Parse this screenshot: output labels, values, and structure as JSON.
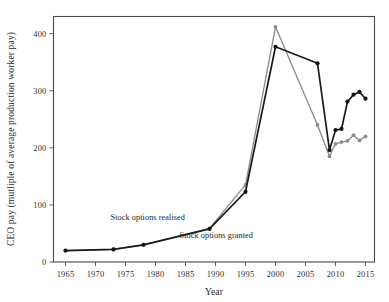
{
  "chart_data": {
    "type": "line",
    "title": "",
    "xlabel": "Year",
    "ylabel": "CEO pay (mutliple of average production worker pay)",
    "xlim": [
      1963,
      2016.5
    ],
    "ylim": [
      0,
      430
    ],
    "xticks": [
      1965,
      1970,
      1975,
      1980,
      1985,
      1990,
      1995,
      2000,
      2005,
      2010,
      2015
    ],
    "xtick_labels": [
      "1965",
      "1970",
      "1975",
      "1980",
      "1985",
      "1990",
      "1995",
      "2000",
      "2005",
      "2010",
      "2015"
    ],
    "yticks": [
      0,
      100,
      200,
      300,
      400
    ],
    "ytick_labels": [
      "0",
      "100",
      "200",
      "300",
      "400"
    ],
    "grid": false,
    "legend_position": "inline-annotations",
    "series": [
      {
        "name": "Stock options realised",
        "color": "#141414",
        "marker": "circle",
        "points": [
          {
            "x": 1965,
            "y": 20
          },
          {
            "x": 1973,
            "y": 22
          },
          {
            "x": 1978,
            "y": 30
          },
          {
            "x": 1989,
            "y": 58
          },
          {
            "x": 1995,
            "y": 123
          },
          {
            "x": 2000,
            "y": 377
          },
          {
            "x": 2007,
            "y": 348
          },
          {
            "x": 2009,
            "y": 196
          },
          {
            "x": 2010,
            "y": 231
          },
          {
            "x": 2011,
            "y": 233
          },
          {
            "x": 2012,
            "y": 281
          },
          {
            "x": 2013,
            "y": 293
          },
          {
            "x": 2014,
            "y": 298
          },
          {
            "x": 2015,
            "y": 286
          }
        ]
      },
      {
        "name": "Stock options granted",
        "color": "#8c8c8c",
        "marker": "circle",
        "points": [
          {
            "x": 1965,
            "y": 20
          },
          {
            "x": 1973,
            "y": 22
          },
          {
            "x": 1978,
            "y": 30
          },
          {
            "x": 1989,
            "y": 59
          },
          {
            "x": 1995,
            "y": 135
          },
          {
            "x": 2000,
            "y": 412
          },
          {
            "x": 2007,
            "y": 240
          },
          {
            "x": 2009,
            "y": 185
          },
          {
            "x": 2010,
            "y": 207
          },
          {
            "x": 2011,
            "y": 210
          },
          {
            "x": 2012,
            "y": 212
          },
          {
            "x": 2013,
            "y": 222
          },
          {
            "x": 2014,
            "y": 213
          },
          {
            "x": 2015,
            "y": 220
          }
        ]
      }
    ],
    "annotations": [
      {
        "text": "Stock options realised",
        "x": 1972.5,
        "y": 74,
        "anchor": "start"
      },
      {
        "text": "Stock options granted",
        "x": 1984.0,
        "y": 42,
        "anchor": "start"
      }
    ]
  }
}
